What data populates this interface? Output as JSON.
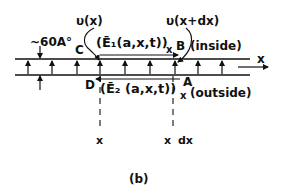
{
  "diagram": {
    "caption": "(b)",
    "thickness_label": "~60A°",
    "labels": {
      "v_x": "υ(x)",
      "v_x_dx": "υ(x+dx)",
      "E1": "(Ē₁(a,x,t))",
      "E1_sub": "x",
      "E2": "(Ē₂ (a,x,t))",
      "E2_sub": "x",
      "inside": "(inside)",
      "outside": "(outside)",
      "axis_x": "x",
      "point_A": "A",
      "point_B": "B",
      "point_C": "C",
      "point_D": "D",
      "tick_x": "x",
      "tick_x2": "x",
      "tick_dx": "dx"
    },
    "membrane": {
      "top_line_y": 59,
      "bottom_line_y": 75,
      "x_start": 15,
      "x_end": 250,
      "arrow_positions": [
        28,
        52,
        77,
        100,
        125,
        150,
        175,
        198,
        222
      ]
    },
    "colors": {
      "ink": "#111111",
      "background": "#ffffff"
    }
  }
}
